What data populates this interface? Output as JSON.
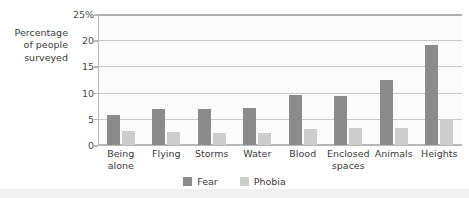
{
  "chart_data": {
    "type": "bar",
    "title": "",
    "xlabel": "",
    "ylabel": "Percentage of people surveyed",
    "categories": [
      "Being alone",
      "Flying",
      "Storms",
      "Water",
      "Blood",
      "Enclosed spaces",
      "Animals",
      "Heights"
    ],
    "series": [
      {
        "name": "Fear",
        "color": "#8b8b8b",
        "values": [
          5.8,
          6.8,
          6.9,
          7.0,
          9.5,
          9.4,
          12.5,
          19.0
        ]
      },
      {
        "name": "Phobia",
        "color": "#cdcdcd",
        "values": [
          2.6,
          2.4,
          2.2,
          2.3,
          3.1,
          3.2,
          3.3,
          5.0
        ]
      }
    ],
    "ylim": [
      0,
      25
    ],
    "yticks": [
      0,
      5,
      10,
      15,
      20,
      25
    ],
    "ytick_labels": [
      "0",
      "5",
      "10",
      "15",
      "20",
      "25%"
    ],
    "grid": true,
    "legend_position": "bottom",
    "legend_entries": [
      "Fear",
      "Phobia"
    ]
  },
  "axis": {
    "y_title": "Percentage\nof people\nsurveyed"
  },
  "legend": {
    "fear_label": "Fear",
    "phobia_label": "Phobia"
  }
}
